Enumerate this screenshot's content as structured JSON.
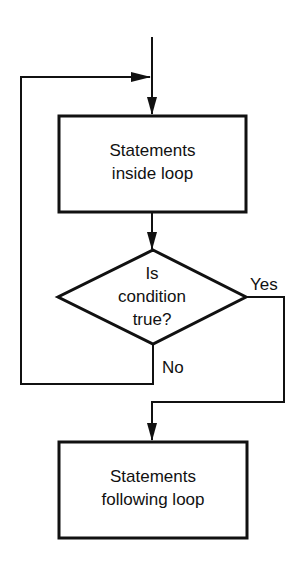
{
  "diagram": {
    "type": "flowchart",
    "title": "",
    "colors": {
      "stroke": "#111111",
      "background": "#ffffff",
      "text": "#111111"
    },
    "nodes": [
      {
        "id": "loop_body",
        "shape": "rectangle",
        "lines": [
          "Statements",
          "inside loop"
        ]
      },
      {
        "id": "condition",
        "shape": "diamond",
        "lines": [
          "Is",
          "condition",
          "true?"
        ]
      },
      {
        "id": "after_loop",
        "shape": "rectangle",
        "lines": [
          "Statements",
          "following loop"
        ]
      }
    ],
    "edges": [
      {
        "from": "entry",
        "to": "loop_body",
        "label": ""
      },
      {
        "from": "loop_body",
        "to": "condition",
        "label": ""
      },
      {
        "from": "condition",
        "to": "loop_body",
        "label": "No"
      },
      {
        "from": "condition",
        "to": "after_loop",
        "label": "Yes"
      }
    ],
    "labels": {
      "yes": "Yes",
      "no": "No"
    }
  }
}
